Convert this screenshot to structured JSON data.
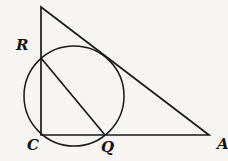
{
  "figure": {
    "type": "geometry-diagram",
    "labels": {
      "R": "R",
      "C": "C",
      "Q": "Q",
      "A": "A"
    },
    "colors": {
      "stroke": "#1a1a1a",
      "background": "#f6f5f1"
    }
  }
}
